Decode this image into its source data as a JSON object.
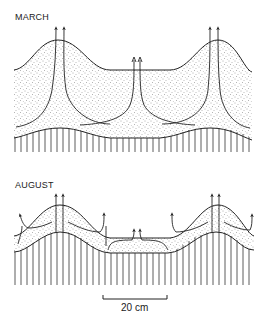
{
  "panels": [
    {
      "id": "march",
      "label": "MARCH"
    },
    {
      "id": "august",
      "label": "AUGUST"
    }
  ],
  "scale_bar": {
    "label": "20 cm"
  },
  "colors": {
    "ink": "#222222",
    "stipple": "#555555",
    "background": "#ffffff"
  }
}
